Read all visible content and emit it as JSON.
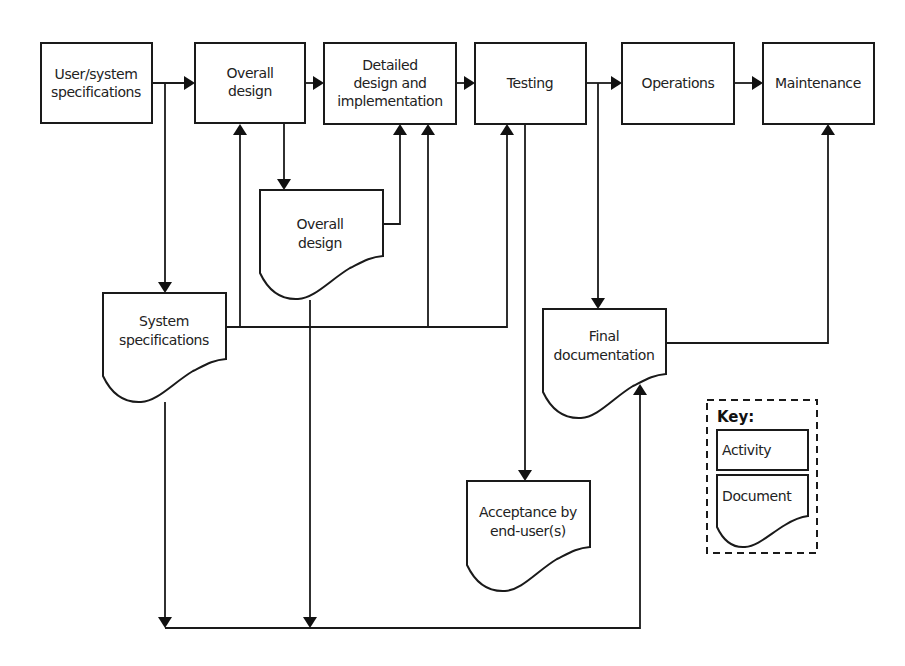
{
  "diagram": {
    "type": "flowchart",
    "activities": [
      {
        "id": "user_system_specs",
        "lines": [
          "User/system",
          "specifications"
        ]
      },
      {
        "id": "overall_design",
        "lines": [
          "Overall",
          "design"
        ]
      },
      {
        "id": "detailed_design",
        "lines": [
          "Detailed",
          "design and",
          "implementation"
        ]
      },
      {
        "id": "testing",
        "lines": [
          "Testing"
        ]
      },
      {
        "id": "operations",
        "lines": [
          "Operations"
        ]
      },
      {
        "id": "maintenance",
        "lines": [
          "Maintenance"
        ]
      }
    ],
    "documents": [
      {
        "id": "overall_design_doc",
        "lines": [
          "Overall",
          "design"
        ]
      },
      {
        "id": "system_specs_doc",
        "lines": [
          "System",
          "specifications"
        ]
      },
      {
        "id": "final_documentation_doc",
        "lines": [
          "Final",
          "documentation"
        ]
      },
      {
        "id": "acceptance_doc",
        "lines": [
          "Acceptance by",
          "end-user(s)"
        ]
      }
    ],
    "edges": [
      {
        "from": "user_system_specs",
        "to": "overall_design"
      },
      {
        "from": "overall_design",
        "to": "detailed_design"
      },
      {
        "from": "detailed_design",
        "to": "testing"
      },
      {
        "from": "testing",
        "to": "operations"
      },
      {
        "from": "operations",
        "to": "maintenance"
      },
      {
        "from": "user_system_specs",
        "to": "system_specs_doc"
      },
      {
        "from": "overall_design",
        "to": "overall_design_doc"
      },
      {
        "from": "overall_design_doc",
        "to": "detailed_design"
      },
      {
        "from": "system_specs_doc",
        "to": "overall_design"
      },
      {
        "from": "system_specs_doc",
        "to": "detailed_design"
      },
      {
        "from": "system_specs_doc",
        "to": "testing"
      },
      {
        "from": "testing",
        "to": "acceptance_doc"
      },
      {
        "from": "testing",
        "to": "final_documentation_doc"
      },
      {
        "from": "final_documentation_doc",
        "to": "maintenance"
      },
      {
        "from": "system_specs_doc",
        "to": "final_documentation_doc"
      },
      {
        "from": "overall_design_doc",
        "to": "final_documentation_doc"
      }
    ],
    "key": {
      "title": "Key:",
      "activity_label": "Activity",
      "document_label": "Document"
    }
  }
}
